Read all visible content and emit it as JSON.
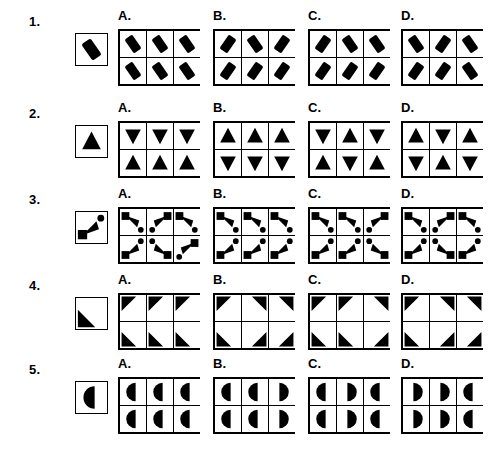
{
  "page": {
    "background_color": "#ffffff",
    "ink_color": "#000000",
    "option_letters": [
      "A.",
      "B.",
      "C.",
      "D."
    ]
  },
  "problems": [
    {
      "number": "1.",
      "shape": "rotated-rounded-bar",
      "key": {
        "glyph": "bar",
        "rotation": -35
      },
      "options": [
        {
          "letter": "A.",
          "cells": [
            {
              "glyph": "bar",
              "rotation": -35
            },
            {
              "glyph": "bar",
              "rotation": -35
            },
            {
              "glyph": "bar",
              "rotation": -35
            },
            {
              "glyph": "bar",
              "rotation": -35
            },
            {
              "glyph": "bar",
              "rotation": -35
            },
            {
              "glyph": "bar",
              "rotation": -35
            }
          ]
        },
        {
          "letter": "B.",
          "cells": [
            {
              "glyph": "bar",
              "rotation": 35
            },
            {
              "glyph": "bar",
              "rotation": -35
            },
            {
              "glyph": "bar",
              "rotation": 35
            },
            {
              "glyph": "bar",
              "rotation": 35
            },
            {
              "glyph": "bar",
              "rotation": 35
            },
            {
              "glyph": "bar",
              "rotation": 35
            }
          ]
        },
        {
          "letter": "C.",
          "cells": [
            {
              "glyph": "bar",
              "rotation": 35
            },
            {
              "glyph": "bar",
              "rotation": -35
            },
            {
              "glyph": "bar",
              "rotation": -35
            },
            {
              "glyph": "bar",
              "rotation": 35
            },
            {
              "glyph": "bar",
              "rotation": 35
            },
            {
              "glyph": "bar",
              "rotation": 35
            }
          ]
        },
        {
          "letter": "D.",
          "cells": [
            {
              "glyph": "bar",
              "rotation": -35
            },
            {
              "glyph": "bar",
              "rotation": 35
            },
            {
              "glyph": "bar",
              "rotation": -35
            },
            {
              "glyph": "bar",
              "rotation": 35
            },
            {
              "glyph": "bar",
              "rotation": 35
            },
            {
              "glyph": "bar",
              "rotation": -35
            }
          ]
        }
      ]
    },
    {
      "number": "2.",
      "shape": "solid-triangle",
      "key": {
        "glyph": "triangle",
        "direction": "up"
      },
      "options": [
        {
          "letter": "A.",
          "cells": [
            {
              "glyph": "triangle",
              "direction": "down"
            },
            {
              "glyph": "triangle",
              "direction": "down"
            },
            {
              "glyph": "triangle",
              "direction": "down"
            },
            {
              "glyph": "triangle",
              "direction": "up"
            },
            {
              "glyph": "triangle",
              "direction": "up"
            },
            {
              "glyph": "triangle",
              "direction": "up"
            }
          ]
        },
        {
          "letter": "B.",
          "cells": [
            {
              "glyph": "triangle",
              "direction": "up"
            },
            {
              "glyph": "triangle",
              "direction": "up"
            },
            {
              "glyph": "triangle",
              "direction": "up"
            },
            {
              "glyph": "triangle",
              "direction": "down"
            },
            {
              "glyph": "triangle",
              "direction": "down"
            },
            {
              "glyph": "triangle",
              "direction": "down"
            }
          ]
        },
        {
          "letter": "C.",
          "cells": [
            {
              "glyph": "triangle",
              "direction": "down"
            },
            {
              "glyph": "triangle",
              "direction": "up"
            },
            {
              "glyph": "triangle",
              "direction": "down"
            },
            {
              "glyph": "triangle",
              "direction": "up"
            },
            {
              "glyph": "triangle",
              "direction": "down"
            },
            {
              "glyph": "triangle",
              "direction": "up"
            }
          ]
        },
        {
          "letter": "D.",
          "cells": [
            {
              "glyph": "triangle",
              "direction": "up"
            },
            {
              "glyph": "triangle",
              "direction": "down"
            },
            {
              "glyph": "triangle",
              "direction": "up"
            },
            {
              "glyph": "triangle",
              "direction": "down"
            },
            {
              "glyph": "triangle",
              "direction": "up"
            },
            {
              "glyph": "triangle",
              "direction": "down"
            }
          ]
        }
      ]
    },
    {
      "number": "3.",
      "shape": "square-arrow-circle-cluster",
      "key": {
        "glyph": "cluster",
        "direction": "up-right"
      },
      "options": [
        {
          "letter": "A.",
          "cells": [
            {
              "glyph": "cluster",
              "direction": "down-right"
            },
            {
              "glyph": "cluster",
              "direction": "down-left"
            },
            {
              "glyph": "cluster",
              "direction": "down-right"
            },
            {
              "glyph": "cluster",
              "direction": "up-right"
            },
            {
              "glyph": "cluster",
              "direction": "up-left"
            },
            {
              "glyph": "cluster",
              "direction": "down-left"
            }
          ]
        },
        {
          "letter": "B.",
          "cells": [
            {
              "glyph": "cluster",
              "direction": "down-right"
            },
            {
              "glyph": "cluster",
              "direction": "down-right"
            },
            {
              "glyph": "cluster",
              "direction": "down-right"
            },
            {
              "glyph": "cluster",
              "direction": "up-right"
            },
            {
              "glyph": "cluster",
              "direction": "up-right"
            },
            {
              "glyph": "cluster",
              "direction": "up-right"
            }
          ]
        },
        {
          "letter": "C.",
          "cells": [
            {
              "glyph": "cluster",
              "direction": "down-right"
            },
            {
              "glyph": "cluster",
              "direction": "down-right"
            },
            {
              "glyph": "cluster",
              "direction": "down-left"
            },
            {
              "glyph": "cluster",
              "direction": "up-right"
            },
            {
              "glyph": "cluster",
              "direction": "up-right"
            },
            {
              "glyph": "cluster",
              "direction": "up-left"
            }
          ]
        },
        {
          "letter": "D.",
          "cells": [
            {
              "glyph": "cluster",
              "direction": "down-right"
            },
            {
              "glyph": "cluster",
              "direction": "down-left"
            },
            {
              "glyph": "cluster",
              "direction": "down-right"
            },
            {
              "glyph": "cluster",
              "direction": "up-right"
            },
            {
              "glyph": "cluster",
              "direction": "up-left"
            },
            {
              "glyph": "cluster",
              "direction": "up-right"
            }
          ]
        }
      ]
    },
    {
      "number": "4.",
      "shape": "corner-triangle",
      "key": {
        "glyph": "corner",
        "direction": "bottom-left"
      },
      "options": [
        {
          "letter": "A.",
          "cells": [
            {
              "glyph": "corner",
              "direction": "top-left"
            },
            {
              "glyph": "corner",
              "direction": "top-left"
            },
            {
              "glyph": "corner",
              "direction": "top-left"
            },
            {
              "glyph": "corner",
              "direction": "bottom-left"
            },
            {
              "glyph": "corner",
              "direction": "bottom-left"
            },
            {
              "glyph": "corner",
              "direction": "bottom-left"
            }
          ]
        },
        {
          "letter": "B.",
          "cells": [
            {
              "glyph": "corner",
              "direction": "top-left"
            },
            {
              "glyph": "corner",
              "direction": "top-right"
            },
            {
              "glyph": "corner",
              "direction": "top-right"
            },
            {
              "glyph": "corner",
              "direction": "bottom-left"
            },
            {
              "glyph": "corner",
              "direction": "bottom-right"
            },
            {
              "glyph": "corner",
              "direction": "bottom-right"
            }
          ]
        },
        {
          "letter": "C.",
          "cells": [
            {
              "glyph": "corner",
              "direction": "top-left"
            },
            {
              "glyph": "corner",
              "direction": "top-left"
            },
            {
              "glyph": "corner",
              "direction": "top-right"
            },
            {
              "glyph": "corner",
              "direction": "bottom-left"
            },
            {
              "glyph": "corner",
              "direction": "bottom-left"
            },
            {
              "glyph": "corner",
              "direction": "bottom-right"
            }
          ]
        },
        {
          "letter": "D.",
          "cells": [
            {
              "glyph": "corner",
              "direction": "top-left"
            },
            {
              "glyph": "corner",
              "direction": "top-right"
            },
            {
              "glyph": "corner",
              "direction": "top-right"
            },
            {
              "glyph": "corner",
              "direction": "bottom-left"
            },
            {
              "glyph": "corner",
              "direction": "bottom-right"
            },
            {
              "glyph": "corner",
              "direction": "bottom-right"
            }
          ]
        }
      ]
    },
    {
      "number": "5.",
      "shape": "half-moon",
      "key": {
        "glyph": "halfmoon",
        "direction": "left"
      },
      "options": [
        {
          "letter": "A.",
          "cells": [
            {
              "glyph": "halfmoon",
              "direction": "left"
            },
            {
              "glyph": "halfmoon",
              "direction": "left"
            },
            {
              "glyph": "halfmoon",
              "direction": "left"
            },
            {
              "glyph": "halfmoon",
              "direction": "left"
            },
            {
              "glyph": "halfmoon",
              "direction": "left"
            },
            {
              "glyph": "halfmoon",
              "direction": "left"
            }
          ]
        },
        {
          "letter": "B.",
          "cells": [
            {
              "glyph": "halfmoon",
              "direction": "left"
            },
            {
              "glyph": "halfmoon",
              "direction": "left"
            },
            {
              "glyph": "halfmoon",
              "direction": "right"
            },
            {
              "glyph": "halfmoon",
              "direction": "left"
            },
            {
              "glyph": "halfmoon",
              "direction": "left"
            },
            {
              "glyph": "halfmoon",
              "direction": "right"
            }
          ]
        },
        {
          "letter": "C.",
          "cells": [
            {
              "glyph": "halfmoon",
              "direction": "left"
            },
            {
              "glyph": "halfmoon",
              "direction": "right"
            },
            {
              "glyph": "halfmoon",
              "direction": "left"
            },
            {
              "glyph": "halfmoon",
              "direction": "left"
            },
            {
              "glyph": "halfmoon",
              "direction": "right"
            },
            {
              "glyph": "halfmoon",
              "direction": "left"
            }
          ]
        },
        {
          "letter": "D.",
          "cells": [
            {
              "glyph": "halfmoon",
              "direction": "right"
            },
            {
              "glyph": "halfmoon",
              "direction": "right"
            },
            {
              "glyph": "halfmoon",
              "direction": "left"
            },
            {
              "glyph": "halfmoon",
              "direction": "right"
            },
            {
              "glyph": "halfmoon",
              "direction": "right"
            },
            {
              "glyph": "halfmoon",
              "direction": "left"
            }
          ]
        }
      ]
    }
  ]
}
